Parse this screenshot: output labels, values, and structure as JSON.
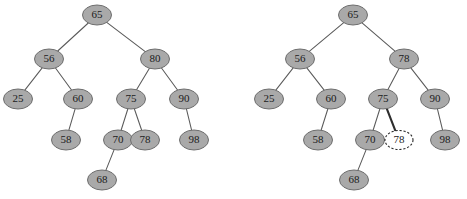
{
  "figure": {
    "background_color": "#ffffff",
    "node_fill": "#a9a9a9",
    "node_stroke": "#6e6e6e",
    "highlight_fill": "#ffffff",
    "highlight_stroke": "#2b2b2b",
    "edge_color": "#5a5a5a",
    "edge_bold_color": "#2e2e2e",
    "label_color": "#1b1b1b"
  },
  "chart_data": {
    "type": "diagram",
    "title": "",
    "subtitle": "",
    "panels": [
      {
        "name": "left-tree",
        "caption": "",
        "nodes": [
          {
            "id": "L-65",
            "label": "65",
            "x": 97,
            "y": 15,
            "rx": 14.5,
            "ry": 10,
            "style": "filled"
          },
          {
            "id": "L-56",
            "label": "56",
            "x": 49,
            "y": 59,
            "rx": 14.5,
            "ry": 10,
            "style": "filled"
          },
          {
            "id": "L-80",
            "label": "80",
            "x": 155,
            "y": 59,
            "rx": 14.5,
            "ry": 10,
            "style": "filled"
          },
          {
            "id": "L-25",
            "label": "25",
            "x": 18,
            "y": 99,
            "rx": 14.5,
            "ry": 10,
            "style": "filled"
          },
          {
            "id": "L-60",
            "label": "60",
            "x": 78,
            "y": 99,
            "rx": 14.5,
            "ry": 10,
            "style": "filled"
          },
          {
            "id": "L-75",
            "label": "75",
            "x": 131,
            "y": 99,
            "rx": 14.5,
            "ry": 10,
            "style": "filled"
          },
          {
            "id": "L-90",
            "label": "90",
            "x": 184,
            "y": 99,
            "rx": 14.5,
            "ry": 10,
            "style": "filled"
          },
          {
            "id": "L-58",
            "label": "58",
            "x": 66,
            "y": 140,
            "rx": 14.5,
            "ry": 10,
            "style": "filled"
          },
          {
            "id": "L-70",
            "label": "70",
            "x": 118,
            "y": 140,
            "rx": 14.5,
            "ry": 10,
            "style": "filled"
          },
          {
            "id": "L-78",
            "label": "78",
            "x": 145,
            "y": 140,
            "rx": 14.5,
            "ry": 10,
            "style": "filled"
          },
          {
            "id": "L-98",
            "label": "98",
            "x": 194,
            "y": 140,
            "rx": 14.5,
            "ry": 10,
            "style": "filled"
          },
          {
            "id": "L-68",
            "label": "68",
            "x": 102,
            "y": 180,
            "rx": 14.5,
            "ry": 10,
            "style": "filled"
          }
        ],
        "edges": [
          {
            "from": "L-65",
            "to": "L-56",
            "style": "normal"
          },
          {
            "from": "L-65",
            "to": "L-80",
            "style": "normal"
          },
          {
            "from": "L-56",
            "to": "L-25",
            "style": "normal"
          },
          {
            "from": "L-56",
            "to": "L-60",
            "style": "normal"
          },
          {
            "from": "L-80",
            "to": "L-75",
            "style": "normal"
          },
          {
            "from": "L-80",
            "to": "L-90",
            "style": "normal"
          },
          {
            "from": "L-60",
            "to": "L-58",
            "style": "normal"
          },
          {
            "from": "L-75",
            "to": "L-70",
            "style": "normal"
          },
          {
            "from": "L-75",
            "to": "L-78",
            "style": "normal"
          },
          {
            "from": "L-90",
            "to": "L-98",
            "style": "normal"
          },
          {
            "from": "L-70",
            "to": "L-68",
            "style": "normal"
          }
        ]
      },
      {
        "name": "right-tree",
        "caption": "",
        "nodes": [
          {
            "id": "R-65",
            "label": "65",
            "x": 353,
            "y": 15,
            "rx": 14.5,
            "ry": 10,
            "style": "filled"
          },
          {
            "id": "R-56",
            "label": "56",
            "x": 300,
            "y": 59,
            "rx": 14.5,
            "ry": 10,
            "style": "filled"
          },
          {
            "id": "R-78",
            "label": "78",
            "x": 404,
            "y": 59,
            "rx": 14.5,
            "ry": 10,
            "style": "filled"
          },
          {
            "id": "R-25",
            "label": "25",
            "x": 269,
            "y": 99,
            "rx": 14.5,
            "ry": 10,
            "style": "filled"
          },
          {
            "id": "R-60",
            "label": "60",
            "x": 331,
            "y": 99,
            "rx": 14.5,
            "ry": 10,
            "style": "filled"
          },
          {
            "id": "R-75",
            "label": "75",
            "x": 383,
            "y": 99,
            "rx": 14.5,
            "ry": 10,
            "style": "filled"
          },
          {
            "id": "R-90",
            "label": "90",
            "x": 435,
            "y": 99,
            "rx": 14.5,
            "ry": 10,
            "style": "filled"
          },
          {
            "id": "R-58",
            "label": "58",
            "x": 318,
            "y": 140,
            "rx": 14.5,
            "ry": 10,
            "style": "filled"
          },
          {
            "id": "R-70",
            "label": "70",
            "x": 370,
            "y": 140,
            "rx": 14.5,
            "ry": 10,
            "style": "filled"
          },
          {
            "id": "R-78b",
            "label": "78",
            "x": 399,
            "y": 140,
            "rx": 14.0,
            "ry": 9.5,
            "style": "dashed-highlight"
          },
          {
            "id": "R-98",
            "label": "98",
            "x": 445,
            "y": 140,
            "rx": 14.5,
            "ry": 10,
            "style": "filled"
          },
          {
            "id": "R-68",
            "label": "68",
            "x": 354,
            "y": 180,
            "rx": 14.5,
            "ry": 10,
            "style": "filled"
          }
        ],
        "edges": [
          {
            "from": "R-65",
            "to": "R-56",
            "style": "normal"
          },
          {
            "from": "R-65",
            "to": "R-78",
            "style": "normal"
          },
          {
            "from": "R-56",
            "to": "R-25",
            "style": "normal"
          },
          {
            "from": "R-56",
            "to": "R-60",
            "style": "normal"
          },
          {
            "from": "R-78",
            "to": "R-75",
            "style": "normal"
          },
          {
            "from": "R-78",
            "to": "R-90",
            "style": "normal"
          },
          {
            "from": "R-60",
            "to": "R-58",
            "style": "normal"
          },
          {
            "from": "R-75",
            "to": "R-70",
            "style": "normal"
          },
          {
            "from": "R-75",
            "to": "R-78b",
            "style": "bold"
          },
          {
            "from": "R-90",
            "to": "R-98",
            "style": "normal"
          },
          {
            "from": "R-70",
            "to": "R-68",
            "style": "normal"
          }
        ]
      }
    ]
  }
}
